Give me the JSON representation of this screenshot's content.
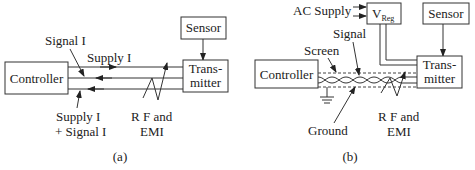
{
  "diagrams": {
    "a": {
      "caption": "(a)",
      "controller": "Controller",
      "sensor": "Sensor",
      "transmitter_line1": "Trans-",
      "transmitter_line2": "mitter",
      "signal_label": "Signal I",
      "supply_label": "Supply I",
      "sum_label_line1": "Supply I",
      "sum_label_line2": "+ Signal I",
      "rf_line1": "R F and",
      "rf_line2": "EMI"
    },
    "b": {
      "caption": "(b)",
      "ac_supply": "AC Supply",
      "vreg_main": "V",
      "vreg_sub": "Reg",
      "controller": "Controller",
      "sensor": "Sensor",
      "transmitter_line1": "Trans-",
      "transmitter_line2": "mitter",
      "signal_label": "Signal",
      "screen_label": "Screen",
      "ground_label": "Ground",
      "rf_line1": "R F and",
      "rf_line2": "EMI"
    }
  }
}
